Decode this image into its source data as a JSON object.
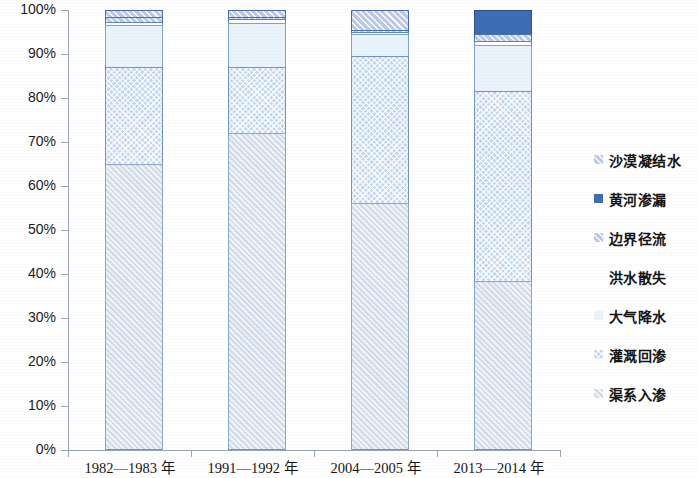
{
  "chart_data": {
    "type": "bar",
    "subtype": "stacked-percent",
    "title": "",
    "xlabel": "",
    "ylabel": "",
    "ylim": [
      0,
      100
    ],
    "y_unit": "%",
    "grid": false,
    "legend_position": "right",
    "categories": [
      "1982—1983 年",
      "1991—1992 年",
      "2004—2005 年",
      "2013—2014 年"
    ],
    "y_ticks": [
      "0%",
      "10%",
      "20%",
      "30%",
      "40%",
      "50%",
      "60%",
      "70%",
      "80%",
      "90%",
      "100%"
    ],
    "stack_order_bottom_to_top": [
      "渠系入渗",
      "灌溉回渗",
      "大气降水",
      "洪水散失",
      "边界径流",
      "黄河渗漏",
      "沙漠凝结水"
    ],
    "series": [
      {
        "name": "渠系入渗",
        "key": "qxrs",
        "color": "#dee5ef",
        "border": "#8aa6cd",
        "values": [
          65.0,
          72.0,
          56.5,
          38.5
        ]
      },
      {
        "name": "灌溉回渗",
        "key": "ggh",
        "color": "#c4d8ef",
        "border": "#6f94c8",
        "values": [
          22.0,
          15.0,
          33.5,
          43.0
        ]
      },
      {
        "name": "大气降水",
        "key": "dqjs",
        "color": "#e9f3fb",
        "border": "#7fa3d0",
        "values": [
          9.5,
          10.0,
          5.0,
          10.5
        ]
      },
      {
        "name": "洪水散失",
        "key": "hsss",
        "color": "#ffffff",
        "border": "#5d83bd",
        "values": [
          0.8,
          1.0,
          0.5,
          1.0
        ]
      },
      {
        "name": "边界径流",
        "key": "bjjl",
        "color": "#b9cbe8",
        "border": "#4a6fae",
        "values": [
          1.2,
          0.5,
          0.5,
          1.5
        ]
      },
      {
        "name": "黄河渗漏",
        "key": "hhsl",
        "color": "#3e6cb5",
        "border": "#2d5193",
        "values": [
          0.0,
          0.0,
          0.0,
          5.5
        ]
      },
      {
        "name": "沙漠凝结水",
        "key": "smnj",
        "color": "#bdc9e6",
        "border": "#4a6cae",
        "values": [
          1.5,
          1.5,
          4.5,
          0.0
        ]
      }
    ],
    "legend_entries_top_to_bottom": [
      {
        "label": "沙漠凝结水",
        "key": "smnj",
        "color": "#bdc9e6",
        "border": "#4a6cae"
      },
      {
        "label": "黄河渗漏",
        "key": "hhsl",
        "color": "#3e6cb5",
        "border": "#2d5193"
      },
      {
        "label": "边界径流",
        "key": "bjjl",
        "color": "#b9cbe8",
        "border": "#4a6fae"
      },
      {
        "label": "洪水散失",
        "key": "hsss",
        "color": "#ffffff",
        "border": "#5d83bd"
      },
      {
        "label": "大气降水",
        "key": "dqjs",
        "color": "#e9f3fb",
        "border": "#7fa3d0"
      },
      {
        "label": "灌溉回渗",
        "key": "ggh",
        "color": "#c4d8ef",
        "border": "#6f94c8"
      },
      {
        "label": "渠系入渗",
        "key": "qxrs",
        "color": "#dee5ef",
        "border": "#8aa6cd"
      }
    ]
  },
  "axis": {
    "y_axis_color": "#9aa4b0",
    "x_axis_color": "#9aa4b0"
  }
}
